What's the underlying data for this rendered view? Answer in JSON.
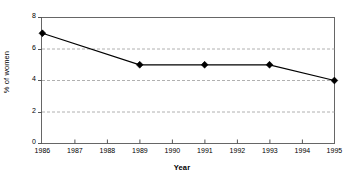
{
  "chart_data": {
    "type": "line",
    "title": "",
    "xlabel": "Year",
    "ylabel": "% of women",
    "x": [
      1986,
      1987,
      1988,
      1989,
      1990,
      1991,
      1992,
      1993,
      1994,
      1995
    ],
    "categories": [
      "1986",
      "1987",
      "1988",
      "1989",
      "1990",
      "1991",
      "1992",
      "1993",
      "1994",
      "1995"
    ],
    "series": [
      {
        "name": "% of women",
        "marker": "diamond",
        "color": "#000000",
        "points": [
          {
            "x": 1986,
            "y": 7,
            "marker": true
          },
          {
            "x": 1989,
            "y": 5,
            "marker": true
          },
          {
            "x": 1991,
            "y": 5,
            "marker": true
          },
          {
            "x": 1993,
            "y": 5,
            "marker": true
          },
          {
            "x": 1995,
            "y": 4,
            "marker": true
          }
        ],
        "values": [
          7,
          null,
          null,
          5,
          null,
          5,
          null,
          5,
          null,
          4
        ]
      }
    ],
    "xlim": [
      1986,
      1995
    ],
    "ylim": [
      0,
      8
    ],
    "yticks": [
      0,
      2,
      4,
      6,
      8
    ],
    "ytick_labels": [
      "0",
      "2",
      "4",
      "6",
      "8"
    ],
    "xticks": [
      1986,
      1987,
      1988,
      1989,
      1990,
      1991,
      1992,
      1993,
      1994,
      1995
    ],
    "xtick_labels": [
      "1986",
      "1987",
      "1988",
      "1989",
      "1990",
      "1991",
      "1992",
      "1993",
      "1994",
      "1995"
    ],
    "grid": {
      "horizontal": true,
      "vertical": false,
      "style": "dashed",
      "color": "#b0b0b0",
      "at": [
        2,
        4,
        6
      ]
    },
    "legend": {
      "visible": false,
      "position": "none"
    },
    "frame": {
      "visible": true,
      "color": "#555555"
    },
    "background": "#ffffff"
  }
}
